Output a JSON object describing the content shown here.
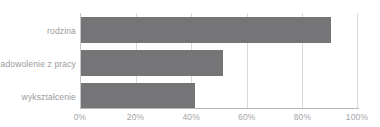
{
  "chart_data": {
    "type": "bar",
    "orientation": "horizontal",
    "title": "",
    "xlabel": "",
    "ylabel": "",
    "categories": [
      "rodzina",
      "zadowolenie z pracy",
      "wykształcenie"
    ],
    "values": [
      90,
      51,
      41
    ],
    "value_suffix": "%",
    "xlim": [
      0,
      100
    ],
    "x_ticks": [
      0,
      20,
      40,
      60,
      80,
      100
    ],
    "x_tick_labels": [
      "0%",
      "20%",
      "40%",
      "60%",
      "80%",
      "100%"
    ],
    "grid": true,
    "grid_axis": "x",
    "legend": false,
    "series": [
      {
        "name": "udział",
        "values": [
          90,
          51,
          41
        ]
      }
    ],
    "colors": {
      "bar": "#757577",
      "grid": "#d9d9dc",
      "axis": "#b9b9bc",
      "category_label": "#9a9a9d",
      "tick_label": "#a5a5a8",
      "background": "#ffffff"
    }
  }
}
